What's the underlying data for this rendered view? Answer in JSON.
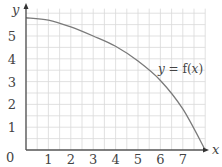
{
  "chart_data": {
    "type": "line",
    "title": "",
    "xlabel": "x",
    "ylabel": "y",
    "xlim": [
      0,
      8
    ],
    "ylim": [
      0,
      6.2
    ],
    "x_ticks": [
      "1",
      "2",
      "3",
      "4",
      "5",
      "6",
      "7"
    ],
    "y_ticks": [
      "1",
      "2",
      "3",
      "4",
      "5"
    ],
    "origin_label": "0",
    "grid": true,
    "grid_step": 0.5,
    "series": [
      {
        "name": "y = f(x)",
        "x": [
          0,
          1,
          2,
          3,
          4,
          5,
          6,
          7,
          8
        ],
        "values": [
          5.8,
          5.7,
          5.4,
          5.0,
          4.55,
          3.9,
          3.05,
          1.8,
          0
        ]
      }
    ],
    "annotations": [
      {
        "text": "y = f(x)",
        "x": 5.9,
        "y": 3.35
      }
    ],
    "colors": {
      "grid": "#d9d9d9",
      "axis": "#555555",
      "curve": "#7a7a7a",
      "text": "#444444"
    }
  },
  "labels": {
    "x_axis": "x",
    "y_axis": "y",
    "origin": "0",
    "curve_y": "y",
    "curve_eq": " = f(",
    "curve_x": "x",
    "curve_close": ")"
  }
}
